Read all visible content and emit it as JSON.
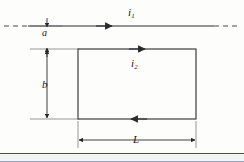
{
  "figure": {
    "background_color": "#fdfdfb",
    "line_color": "#2a2a2e",
    "labels": {
      "current_wire": "i",
      "current_wire_sub": "1",
      "current_loop": "i",
      "current_loop_sub": "2",
      "separation": "a",
      "loop_height": "b",
      "loop_width": "L"
    },
    "elements": {
      "wire": {
        "name": "long straight wire",
        "y": 26,
        "x_start": 4,
        "x_end": 240,
        "dashed_left_end": true,
        "dashed_right_end": true,
        "current_arrow_direction": "right",
        "current_arrow_x": 105
      },
      "loop": {
        "name": "rectangular conducting loop",
        "left": 78,
        "right": 196,
        "top": 49,
        "bottom": 119,
        "top_arrow_direction": "right",
        "top_arrow_x": 138,
        "bottom_arrow_direction": "left",
        "bottom_arrow_x": 138
      },
      "dimension_a": {
        "name": "separation between wire and loop",
        "x": 47,
        "y_start": 26,
        "y_end": 49,
        "style": "double-arrow-split-by-label"
      },
      "dimension_b": {
        "name": "loop height dimension",
        "x": 47,
        "y_start": 49,
        "y_end": 119,
        "style": "double-headed-vertical-arrow"
      },
      "dimension_L": {
        "name": "loop width dimension",
        "y": 140,
        "x_start": 78,
        "x_end": 196,
        "style": "double-headed-horizontal-arrow"
      }
    },
    "footer_band": {
      "present": true,
      "color": "#f2f4f8",
      "rule_color": "#3f4f78"
    }
  }
}
